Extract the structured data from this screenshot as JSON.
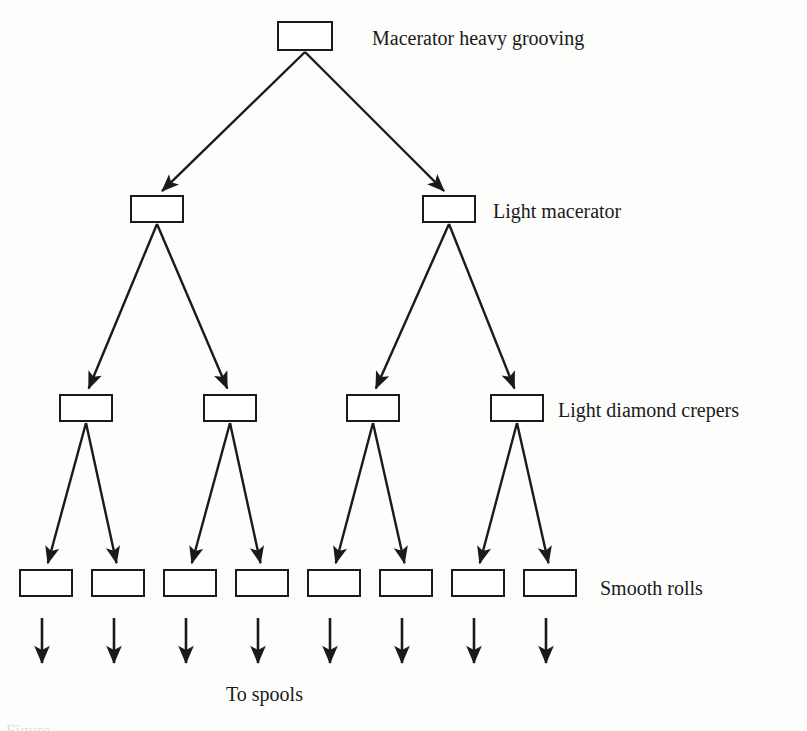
{
  "figure": {
    "type": "tree-flow-diagram",
    "background_color": "#fdfdfc",
    "stroke_color": "#1a1a1a",
    "box_fill_color": "#ffffff",
    "bottom_caption": "To spools",
    "cropped_figure_caption": "Figure",
    "levels": [
      {
        "index": 0,
        "label": "Macerator heavy grooving",
        "label_x": 372,
        "label_y": 28,
        "node_count": 1,
        "box_width": 54,
        "box_height": 28,
        "box_y": 22,
        "node_centers_x": [
          305
        ]
      },
      {
        "index": 1,
        "label": "Light macerator",
        "label_x": 493,
        "label_y": 201,
        "node_count": 2,
        "box_width": 52,
        "box_height": 26,
        "box_y": 196,
        "node_centers_x": [
          157,
          449
        ]
      },
      {
        "index": 2,
        "label": "Light diamond crepers",
        "label_x": 558,
        "label_y": 400,
        "node_count": 4,
        "box_width": 52,
        "box_height": 26,
        "box_y": 395,
        "node_centers_x": [
          86,
          230,
          373,
          517
        ]
      },
      {
        "index": 3,
        "label": "Smooth rolls",
        "label_x": 600,
        "label_y": 578,
        "node_count": 8,
        "box_width": 52,
        "box_height": 26,
        "box_y": 570,
        "node_centers_x": [
          46,
          118,
          190,
          262,
          334,
          406,
          478,
          550
        ]
      }
    ],
    "terminal_arrows": {
      "count": 8,
      "start_y": 618,
      "end_y": 670,
      "x_positions": [
        42,
        114,
        186,
        258,
        330,
        402,
        474,
        546
      ]
    },
    "edges": [
      {
        "from_level": 0,
        "from_index": 0,
        "to_level": 1,
        "to_index": 0
      },
      {
        "from_level": 0,
        "from_index": 0,
        "to_level": 1,
        "to_index": 1
      },
      {
        "from_level": 1,
        "from_index": 0,
        "to_level": 2,
        "to_index": 0
      },
      {
        "from_level": 1,
        "from_index": 0,
        "to_level": 2,
        "to_index": 1
      },
      {
        "from_level": 1,
        "from_index": 1,
        "to_level": 2,
        "to_index": 2
      },
      {
        "from_level": 1,
        "from_index": 1,
        "to_level": 2,
        "to_index": 3
      },
      {
        "from_level": 2,
        "from_index": 0,
        "to_level": 3,
        "to_index": 0
      },
      {
        "from_level": 2,
        "from_index": 0,
        "to_level": 3,
        "to_index": 1
      },
      {
        "from_level": 2,
        "from_index": 1,
        "to_level": 3,
        "to_index": 2
      },
      {
        "from_level": 2,
        "from_index": 1,
        "to_level": 3,
        "to_index": 3
      },
      {
        "from_level": 2,
        "from_index": 2,
        "to_level": 3,
        "to_index": 4
      },
      {
        "from_level": 2,
        "from_index": 2,
        "to_level": 3,
        "to_index": 5
      },
      {
        "from_level": 2,
        "from_index": 3,
        "to_level": 3,
        "to_index": 6
      },
      {
        "from_level": 2,
        "from_index": 3,
        "to_level": 3,
        "to_index": 7
      }
    ]
  }
}
